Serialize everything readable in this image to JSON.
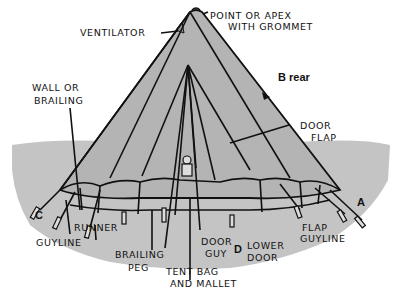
{
  "diagram": {
    "colors": {
      "tent": "#b4b4b4",
      "ground": "#c4c4c4",
      "ink": "#111111",
      "background": "#ffffff"
    },
    "labels": {
      "ventilator": "VENTILATOR",
      "apex_line1": "POINT OR APEX",
      "apex_line2": "WITH GROMMET",
      "wall_line1": "WALL OR",
      "wall_line2": "BRAILING",
      "rear": "B rear",
      "door_flap_line1": "DOOR",
      "door_flap_line2": "FLAP",
      "corner_c": "C",
      "corner_a": "A",
      "corner_d": "D",
      "runner": "RUNNER",
      "guyline": "GUYLINE",
      "brailing_peg_line1": "BRAILING",
      "brailing_peg_line2": "PEG",
      "tent_bag_line1": "TENT BAG",
      "tent_bag_line2": "AND MALLET",
      "door_guy_line1": "DOOR",
      "door_guy_line2": "GUY",
      "lower_door_line1": "LOWER",
      "lower_door_line2": "DOOR",
      "flap_guyline_line1": "FLAP",
      "flap_guyline_line2": "GUYLINE"
    }
  }
}
